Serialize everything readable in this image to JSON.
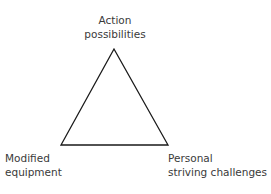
{
  "diagram": {
    "type": "triangle",
    "nodes": [
      {
        "id": "top",
        "lines": [
          "Action",
          "possibilities"
        ]
      },
      {
        "id": "bottom-left",
        "lines": [
          "Modified",
          "equipment"
        ]
      },
      {
        "id": "bottom-right",
        "lines": [
          "Personal",
          "striving challenges"
        ]
      }
    ],
    "edges": [
      [
        "top",
        "bottom-left"
      ],
      [
        "top",
        "bottom-right"
      ],
      [
        "bottom-left",
        "bottom-right"
      ]
    ],
    "stroke_color": "#1a1a1a"
  }
}
